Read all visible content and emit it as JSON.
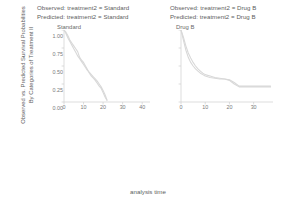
{
  "figure": {
    "xlabel": "analysis time",
    "ylabel_line1": "Observed vs. Predicted Survival Probabilities",
    "ylabel_line2": "By Categories of Treatment II",
    "line_color": "#d8d8d8",
    "axis_color": "#cfcfcf",
    "text_color": "#5d5d5d"
  },
  "legends": {
    "left": {
      "observed": "Observed: treatment2 = Standard",
      "predicted": "Predicted: treatment2 = Standard"
    },
    "right": {
      "observed": "Observed: treatment2 = Drug B",
      "predicted": "Predicted: treatment2 = Drug B"
    }
  },
  "panels": [
    {
      "title": "Standard"
    },
    {
      "title": "Drug B"
    }
  ],
  "chart_data": {
    "type": "line",
    "title": "",
    "xlabel": "analysis time",
    "ylabel": "Observed vs. Predicted Survival Probabilities By Categories of Treatment II",
    "grid": false,
    "legend_position": "top",
    "panels": [
      {
        "panel_title": "Standard",
        "legend": [
          "Observed: treatment2 = Standard",
          "Predicted: treatment2 = Standard"
        ],
        "xlim": [
          0,
          44
        ],
        "ylim": [
          0,
          1.0
        ],
        "xticks": [
          0,
          10,
          20,
          30,
          40
        ],
        "xticklabels": [
          "0",
          "10",
          "20",
          "30",
          "40"
        ],
        "yticks": [
          0.0,
          0.25,
          0.5,
          0.75,
          1.0
        ],
        "yticklabels": [
          "0.00",
          "0.25",
          "0.50",
          "0.75",
          "1.00"
        ],
        "series": [
          {
            "name": "Observed: treatment2 = Standard",
            "x": [
              0,
              1,
              2,
              3,
              4,
              5,
              6,
              7,
              8,
              9,
              10,
              11,
              12,
              13,
              14,
              15,
              16,
              17,
              18,
              19,
              20,
              21,
              22
            ],
            "y": [
              1.0,
              0.97,
              0.92,
              0.86,
              0.82,
              0.78,
              0.74,
              0.7,
              0.62,
              0.58,
              0.55,
              0.5,
              0.45,
              0.4,
              0.36,
              0.33,
              0.3,
              0.26,
              0.22,
              0.19,
              0.13,
              0.07,
              0.02
            ]
          },
          {
            "name": "Predicted: treatment2 = Standard",
            "x": [
              0,
              1,
              2,
              3,
              4,
              5,
              6,
              7,
              8,
              9,
              10,
              11,
              12,
              13,
              14,
              15,
              16,
              17,
              18,
              19,
              20,
              21,
              22
            ],
            "y": [
              1.0,
              0.95,
              0.89,
              0.84,
              0.79,
              0.74,
              0.69,
              0.64,
              0.6,
              0.56,
              0.52,
              0.48,
              0.44,
              0.41,
              0.38,
              0.35,
              0.32,
              0.29,
              0.25,
              0.21,
              0.16,
              0.1,
              0.03
            ]
          }
        ]
      },
      {
        "panel_title": "Drug B",
        "legend": [
          "Observed: treatment2 = Drug B",
          "Predicted: treatment2 = Drug B"
        ],
        "xlim": [
          0,
          38
        ],
        "ylim": [
          0,
          1.0
        ],
        "xticks": [
          0,
          10,
          20,
          30
        ],
        "xticklabels": [
          "0",
          "10",
          "20",
          "30"
        ],
        "yticks": [
          0.0,
          0.25,
          0.5,
          0.75,
          1.0
        ],
        "yticklabels": [
          "",
          "",
          "",
          "",
          ""
        ],
        "series": [
          {
            "name": "Observed: treatment2 = Drug B",
            "x": [
              0,
              1,
              2,
              3,
              4,
              5,
              6,
              7,
              8,
              9,
              10,
              12,
              14,
              16,
              18,
              20,
              22,
              24,
              26,
              30,
              34,
              37
            ],
            "y": [
              1.0,
              0.86,
              0.72,
              0.62,
              0.55,
              0.5,
              0.46,
              0.43,
              0.4,
              0.38,
              0.36,
              0.34,
              0.33,
              0.32,
              0.32,
              0.31,
              0.27,
              0.22,
              0.22,
              0.22,
              0.22,
              0.22
            ]
          },
          {
            "name": "Predicted: treatment2 = Drug B",
            "x": [
              0,
              1,
              2,
              3,
              4,
              5,
              6,
              7,
              8,
              9,
              10,
              12,
              14,
              16,
              18,
              20,
              22,
              24,
              26,
              30,
              34,
              37
            ],
            "y": [
              1.0,
              0.9,
              0.78,
              0.68,
              0.61,
              0.55,
              0.5,
              0.46,
              0.43,
              0.4,
              0.38,
              0.36,
              0.34,
              0.33,
              0.32,
              0.3,
              0.25,
              0.21,
              0.21,
              0.21,
              0.21,
              0.21
            ]
          }
        ]
      }
    ]
  }
}
